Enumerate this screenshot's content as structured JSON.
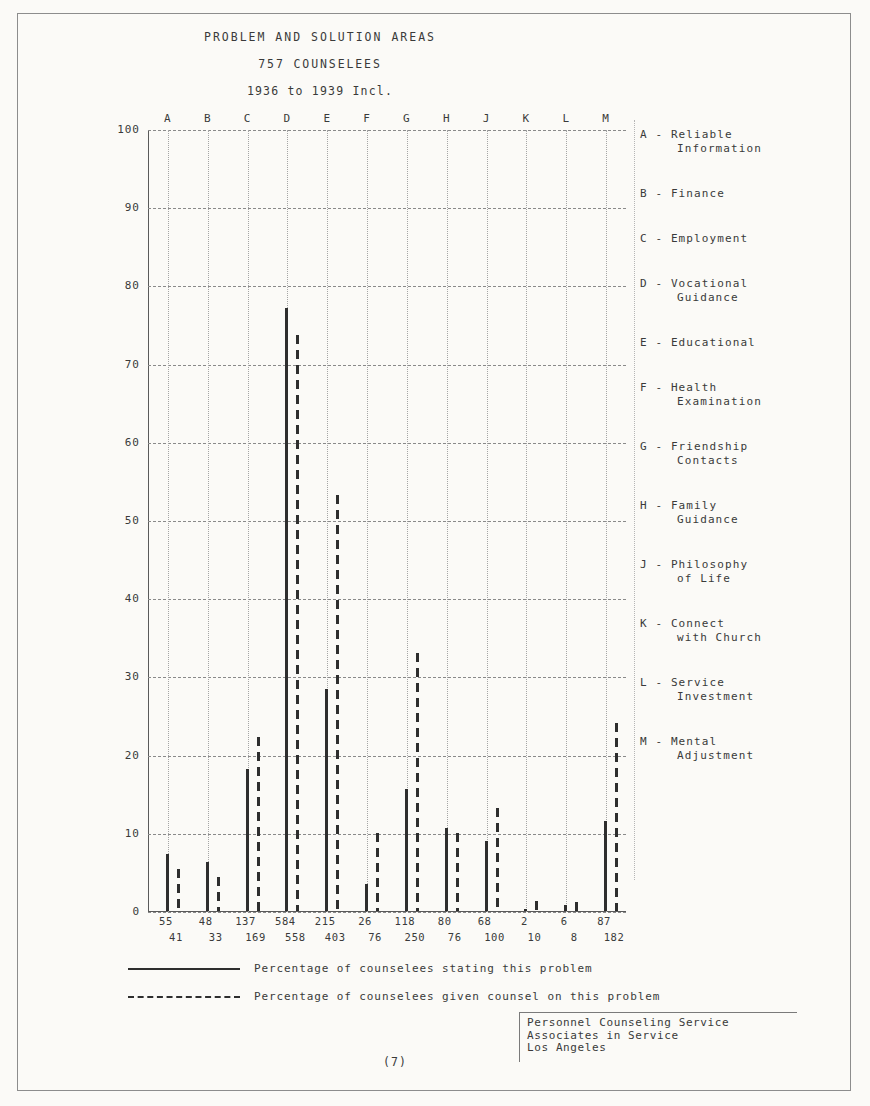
{
  "document": {
    "page_number": "(7)"
  },
  "chart_data": {
    "type": "bar",
    "title": "PROBLEM AND SOLUTION AREAS",
    "subtitle": "757 COUNSELEES",
    "subtitle2": "1936 to 1939 Incl.",
    "xlabel": "",
    "ylabel": "",
    "ylim": [
      0,
      100
    ],
    "ytick_labels": [
      "0",
      "10",
      "20",
      "30",
      "40",
      "50",
      "60",
      "70",
      "80",
      "90",
      "100"
    ],
    "yticks": [
      0,
      10,
      20,
      30,
      40,
      50,
      60,
      70,
      80,
      90,
      100
    ],
    "grid": true,
    "legend_position": "bottom",
    "categories": [
      "A",
      "B",
      "C",
      "D",
      "E",
      "F",
      "G",
      "H",
      "J",
      "K",
      "L",
      "M"
    ],
    "series": [
      {
        "name": "Percentage of counselees stating this problem",
        "style": "solid",
        "values": [
          7.3,
          6.3,
          18.1,
          77.1,
          28.4,
          3.4,
          15.6,
          10.6,
          9.0,
          0.3,
          0.8,
          11.5
        ],
        "counts": [
          55,
          48,
          137,
          584,
          215,
          26,
          118,
          80,
          68,
          2,
          6,
          87
        ]
      },
      {
        "name": "Percentage of counselees given counsel on this problem",
        "style": "dashed",
        "values": [
          5.4,
          4.4,
          22.3,
          73.7,
          53.2,
          10.0,
          33.0,
          10.0,
          13.2,
          1.3,
          1.1,
          24.0
        ],
        "counts": [
          41,
          33,
          169,
          558,
          403,
          76,
          250,
          76,
          100,
          10,
          8,
          182
        ]
      }
    ]
  },
  "key": {
    "items": [
      {
        "line1": "A - Reliable",
        "line2": "Information"
      },
      {
        "line1": "B - Finance",
        "line2": ""
      },
      {
        "line1": "C - Employment",
        "line2": ""
      },
      {
        "line1": "D - Vocational",
        "line2": "Guidance"
      },
      {
        "line1": "E - Educational",
        "line2": ""
      },
      {
        "line1": "F - Health",
        "line2": "Examination"
      },
      {
        "line1": "G - Friendship",
        "line2": "Contacts"
      },
      {
        "line1": "H - Family",
        "line2": "Guidance"
      },
      {
        "line1": "J - Philosophy",
        "line2": "of Life"
      },
      {
        "line1": "K - Connect",
        "line2": "with Church"
      },
      {
        "line1": "L - Service",
        "line2": "Investment"
      },
      {
        "line1": "M - Mental",
        "line2": "Adjustment"
      }
    ]
  },
  "footer": {
    "line1": "Personnel Counseling Service",
    "line2": "Associates in Service",
    "line3": "Los Angeles"
  }
}
